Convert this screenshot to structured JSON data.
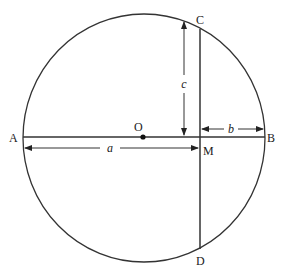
{
  "diagram": {
    "points": {
      "A": "A",
      "B": "B",
      "C": "C",
      "D": "D",
      "M": "M",
      "O": "O"
    },
    "dimensions": {
      "a": "a",
      "b": "b",
      "c": "c"
    },
    "elements": [
      {
        "name": "circle",
        "center": "O"
      },
      {
        "name": "diameter",
        "from": "A",
        "to": "B"
      },
      {
        "name": "chord",
        "from": "C",
        "to": "D",
        "perpendicular_to": "AB",
        "at": "M"
      },
      {
        "name": "dimension-a",
        "from": "A",
        "to": "M",
        "label": "a"
      },
      {
        "name": "dimension-b",
        "from": "M",
        "to": "B",
        "label": "b"
      },
      {
        "name": "dimension-c",
        "from": "M",
        "to": "C",
        "label": "c"
      }
    ]
  }
}
